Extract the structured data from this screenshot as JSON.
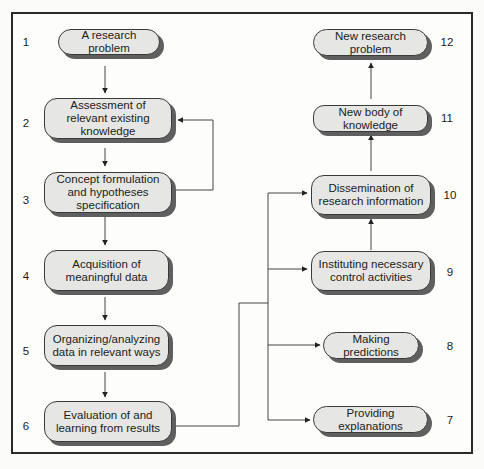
{
  "diagram": {
    "type": "flowchart",
    "left_column": [
      {
        "number": "1",
        "label": "A research problem"
      },
      {
        "number": "2",
        "label": "Assessment of relevant existing knowledge"
      },
      {
        "number": "3",
        "label": "Concept formulation and hypotheses specification"
      },
      {
        "number": "4",
        "label": "Acquisition of meaningful data"
      },
      {
        "number": "5",
        "label": "Organizing/analyzing data in relevant ways"
      },
      {
        "number": "6",
        "label": "Evaluation of and learning from results"
      }
    ],
    "right_column": [
      {
        "number": "12",
        "label": "New research problem"
      },
      {
        "number": "11",
        "label": "New body of knowledge"
      },
      {
        "number": "10",
        "label": "Dissemination of research information"
      },
      {
        "number": "9",
        "label": "Instituting necessary control activities"
      },
      {
        "number": "8",
        "label": "Making predictions"
      },
      {
        "number": "7",
        "label": "Providing explanations"
      }
    ],
    "edges": [
      {
        "from": "1",
        "to": "2"
      },
      {
        "from": "2",
        "to": "3"
      },
      {
        "from": "3",
        "to": "2",
        "note": "feedback loop"
      },
      {
        "from": "3",
        "to": "4"
      },
      {
        "from": "4",
        "to": "5"
      },
      {
        "from": "5",
        "to": "6"
      },
      {
        "from": "6",
        "to": "7"
      },
      {
        "from": "6",
        "to": "8"
      },
      {
        "from": "6",
        "to": "9"
      },
      {
        "from": "6",
        "to": "10"
      },
      {
        "from": "9",
        "to": "10"
      },
      {
        "from": "10",
        "to": "11"
      },
      {
        "from": "11",
        "to": "12"
      }
    ]
  },
  "colors": {
    "box_fill": "#e6e6e4",
    "box_border": "#3a3a3a",
    "box_shadow": "#5f5f5f",
    "line": "#444444",
    "frame": "#2a2a2a"
  }
}
